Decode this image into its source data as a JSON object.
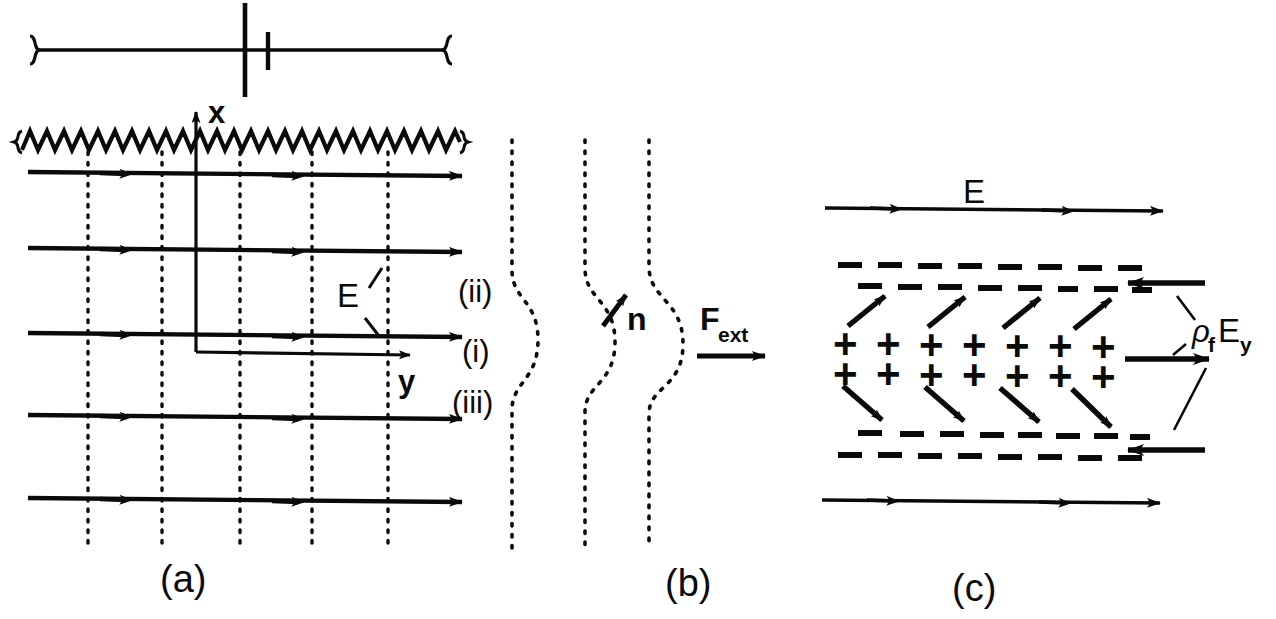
{
  "figure": {
    "background_color": "#ffffff",
    "ink_color": "#0a0a0a",
    "width": 1276,
    "height": 619,
    "panel_labels": [
      {
        "id": "panel-a",
        "text": "(a)",
        "x": 182,
        "y": 592
      },
      {
        "id": "panel-b",
        "text": "(b)",
        "x": 688,
        "y": 596
      },
      {
        "id": "panel-c",
        "text": "(c)",
        "x": 975,
        "y": 601
      }
    ]
  },
  "panel_a": {
    "axis_x_label": "x",
    "axis_y_label": "y",
    "field_label": "E",
    "region_labels": [
      {
        "key": "region-ii",
        "text": "(ii)",
        "x": 458,
        "y": 302
      },
      {
        "key": "region-i",
        "text": "(i)",
        "x": 462,
        "y": 362
      },
      {
        "key": "region-iii",
        "text": "(iii)",
        "x": 452,
        "y": 410
      }
    ],
    "num_field_lines": 5,
    "num_dotted_verticals": 5,
    "field_line_rows_y": [
      172,
      248,
      333,
      415,
      498
    ],
    "dotted_vertical_x": [
      88,
      162,
      240,
      312,
      388
    ],
    "zigzag_boundary": {
      "x_start": 22,
      "x_end": 460,
      "y": 140,
      "amplitude": 11,
      "period": 17
    },
    "top_bracket": {
      "x_start": 30,
      "x_end": 452,
      "y": 50
    }
  },
  "panel_b": {
    "normal_label": "n",
    "force_label_base": "F",
    "force_label_sub": "ext",
    "num_curves": 3,
    "curve_x_positions": [
      510,
      583,
      647
    ],
    "curve_bulge_amount": [
      26,
      30,
      34
    ]
  },
  "panel_c": {
    "field_label": "E",
    "charge_force_label_rho": "ρ",
    "charge_force_label_rho_sub": "f",
    "charge_force_label_e": "E",
    "charge_force_label_e_sub": "y",
    "plus_glyph": "+",
    "plus_rows": 2,
    "plus_per_row": 7,
    "plus_row_y": [
      343,
      372
    ],
    "plus_x": [
      845,
      888,
      931,
      974,
      1017,
      1060,
      1103
    ],
    "dash_rows_y": [
      265,
      285,
      437,
      457
    ],
    "dashes_per_row": 8,
    "top_field_line_y": 208,
    "bottom_field_line_y": 500,
    "field_line_x_start": 825,
    "field_line_x_end": 1160
  }
}
